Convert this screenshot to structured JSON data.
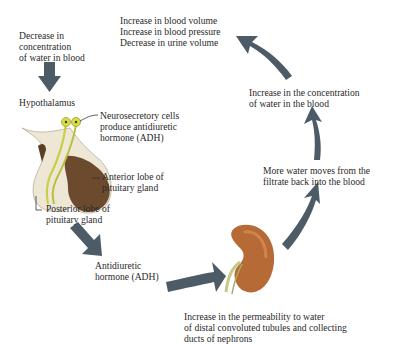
{
  "diagram": {
    "colors": {
      "arrow": "#4d5b66",
      "text": "#2a2a2a",
      "neuron": "#c9cf4a",
      "anterior_lobe": "#6b4a2e",
      "posterior_lobe": "#efe7d6",
      "kidney": "#b66a36"
    },
    "labels": {
      "stimulus": "Decrease in\nconcentration\nof water in blood",
      "hypothalamus": "Hypothalamus",
      "neurosecretory": "Neurosecretory cells\nproduce antidiuretic\nhormone (ADH)",
      "anterior_lobe": "Anterior lobe of\npituitary gland",
      "posterior_lobe": "Posterior lobe of\npituitary gland",
      "adh": "Antidiuretic\nhormone (ADH)",
      "permeability": "Increase in the permeability to water\nof distal convoluted tubules and collecting\nducts of nephrons",
      "reabsorption": "More water moves from the\nfiltrate back into the blood",
      "concentration_increase": "Increase in the concentration\nof water in the blood",
      "outcomes": "Increase in blood volume\nIncrease in blood pressure\nDecrease in urine volume"
    },
    "icons": [
      "pituitary-illustration",
      "kidney-illustration",
      "flow-arrow"
    ]
  }
}
